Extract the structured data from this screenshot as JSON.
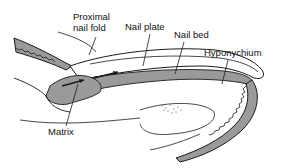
{
  "diagram": {
    "labels": {
      "proximal_nail_fold_line1": "Proximal",
      "proximal_nail_fold_line2": "nail fold",
      "nail_plate": "Nail plate",
      "nail_bed": "Nail bed",
      "hyponychium": "Hyponychium",
      "matrix": "Matrix"
    },
    "colors": {
      "background": "#ffffff",
      "outline": "#1a1a1a",
      "tissue_shade": "#9a9a9a",
      "text": "#111111"
    }
  }
}
